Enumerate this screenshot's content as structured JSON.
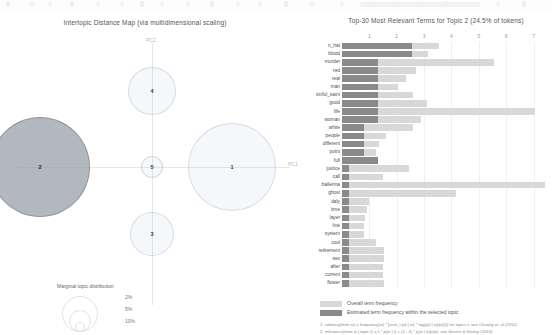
{
  "top_chrome": {
    "visible": true
  },
  "left_panel": {
    "title": "Intertopic Distance Map (via multidimensional scaling)",
    "axis": {
      "x_label": "PC1",
      "y_label": "PC2"
    },
    "topics": [
      {
        "id": "1",
        "label": "1",
        "cx": 232,
        "cy": 156,
        "r": 44,
        "selected": false
      },
      {
        "id": "2",
        "label": "2",
        "cx": 40,
        "cy": 156,
        "r": 50,
        "selected": true
      },
      {
        "id": "3",
        "label": "3",
        "cx": 152,
        "cy": 223,
        "r": 22,
        "selected": false
      },
      {
        "id": "4",
        "label": "4",
        "cx": 152,
        "cy": 80,
        "r": 24,
        "selected": false
      },
      {
        "id": "5",
        "label": "5",
        "cx": 152,
        "cy": 156,
        "r": 11,
        "selected": false
      }
    ],
    "marginal": {
      "title": "Marginal topic distribution",
      "items": [
        {
          "pct": "2%",
          "r": 5
        },
        {
          "pct": "5%",
          "r": 11
        },
        {
          "pct": "10%",
          "r": 18
        }
      ]
    }
  },
  "right_panel": {
    "title": "Top-30 Most Relevant Terms for Topic 2 (24.5% of tokens)",
    "legend": [
      {
        "key": "overall",
        "label": "Overall term frequency",
        "color": "#d8d8d8"
      },
      {
        "key": "topic",
        "label": "Estimated term frequency within the selected topic",
        "color": "#8a8a8a"
      }
    ],
    "footnotes": [
      "1. saliency(term w) = frequency(w) * [sum_t p(t | w) * log(p(t | w)/p(t))] for topics t; see Chuang et. al (2012)",
      "2. relevance(term w | topic t) = λ * p(w | t) + (1 - λ) * p(w | t)/p(w); see Sievert & Shirley (2014)"
    ]
  },
  "chart_data": {
    "type": "bar",
    "title": "Top-30 Most Relevant Terms for Topic 2 (24.5% of tokens)",
    "xlabel": "",
    "ylabel": "",
    "orientation": "horizontal",
    "xlim": [
      0,
      7.6
    ],
    "xticks": [
      1,
      2,
      3,
      4,
      5,
      6,
      7
    ],
    "grid": true,
    "legend_position": "bottom-left",
    "categories": [
      "n_hat",
      "blood",
      "murder",
      "red",
      "real",
      "man",
      "sinful_saint",
      "good",
      "life",
      "woman",
      "white",
      "people",
      "different",
      "point",
      "full",
      "justice",
      "call",
      "ballerina",
      "ghost",
      "daly",
      "time",
      "layer",
      "line",
      "system",
      "cool",
      "retirement",
      "sex",
      "after",
      "current",
      "flower"
    ],
    "series": [
      {
        "name": "Overall term frequency",
        "color": "#d8d8d8",
        "values": [
          3.55,
          3.15,
          5.55,
          2.7,
          2.35,
          2.05,
          2.6,
          3.1,
          7.05,
          2.9,
          2.6,
          1.6,
          1.35,
          1.25,
          1.2,
          2.45,
          1.5,
          7.4,
          4.15,
          1.0,
          0.9,
          0.85,
          0.8,
          0.8,
          1.25,
          1.55,
          1.55,
          1.5,
          1.5,
          1.55
        ]
      },
      {
        "name": "Estimated term frequency within the selected topic",
        "color": "#8a8a8a",
        "values": [
          2.55,
          2.55,
          1.3,
          1.3,
          1.3,
          1.3,
          1.3,
          1.3,
          1.3,
          1.3,
          0.8,
          0.8,
          0.8,
          0.8,
          1.3,
          0.25,
          0.25,
          0.25,
          0.25,
          0.25,
          0.25,
          0.25,
          0.25,
          0.25,
          0.25,
          0.25,
          0.25,
          0.25,
          0.25,
          0.25
        ]
      }
    ]
  }
}
